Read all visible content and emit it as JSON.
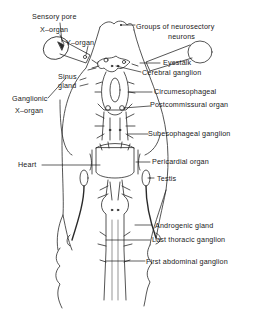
{
  "diagram": {
    "type": "labeled anatomical line drawing",
    "labels": {
      "sensory_pore": "Sensory pore",
      "x_organ": "X–organ",
      "y_organ": "Y–organ",
      "groups_neurosecretory_1": "Groups of neurosectory",
      "groups_neurosecretory_2": "neurons",
      "eyestalk": "Eyestalk",
      "sinus_gland_1": "Sinus",
      "sinus_gland_2": "gland",
      "cerebral_ganglion": "Cerebral ganglion",
      "ganglionic_x_organ_1": "Ganglionic",
      "ganglionic_x_organ_2": "X–organ",
      "circumesophageal": "Circumesophageal",
      "postcommissural_organ": "Postcommissural organ",
      "subesophageal_ganglion": "Subesophageal ganglion",
      "heart": "Heart",
      "pericardial_organ": "Pericardial organ",
      "testis": "Testis",
      "androgenic_gland": "Androgenic gland",
      "last_thoracic_ganglion": "Last thoracic ganglion",
      "first_abdominal_ganglion": "First abdominal ganglion"
    },
    "colors": {
      "line": "#2a2a2a",
      "text": "#1a1a1a",
      "background": "#ffffff"
    }
  }
}
